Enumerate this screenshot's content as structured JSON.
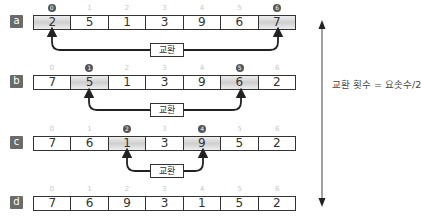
{
  "indices": [
    "0",
    "1",
    "2",
    "3",
    "4",
    "5",
    "6"
  ],
  "rows": [
    {
      "label": "a",
      "values": [
        "2",
        "5",
        "1",
        "3",
        "9",
        "6",
        "7"
      ],
      "highlight": [
        0,
        6
      ],
      "circled": {
        "0": "0",
        "6": "6"
      }
    },
    {
      "label": "b",
      "values": [
        "7",
        "5",
        "1",
        "3",
        "9",
        "6",
        "2"
      ],
      "highlight": [
        1,
        5
      ],
      "circled": {
        "1": "1",
        "5": "5"
      }
    },
    {
      "label": "c",
      "values": [
        "7",
        "6",
        "1",
        "3",
        "9",
        "5",
        "2"
      ],
      "highlight": [
        2,
        4
      ],
      "circled": {
        "2": "2",
        "4": "4"
      }
    },
    {
      "label": "d",
      "values": [
        "7",
        "6",
        "9",
        "3",
        "1",
        "5",
        "2"
      ],
      "highlight": [],
      "circled": {}
    }
  ],
  "swap_label": "교환",
  "formula": "교환 횟수 = 요솟수/2",
  "colors": {
    "highlight": "#d6d6d6",
    "tag": "#6b6b6b",
    "line": "#333333"
  }
}
